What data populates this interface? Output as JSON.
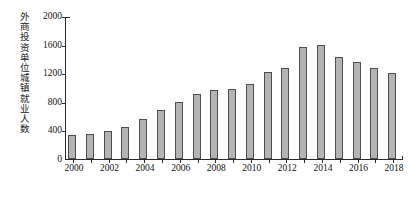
{
  "chart_data": {
    "type": "bar",
    "title": "",
    "xlabel": "",
    "ylabel": "外商投资单位城镇就业人数",
    "ylim": [
      0,
      2000
    ],
    "yticks": [
      0,
      400,
      800,
      1200,
      1600,
      2000
    ],
    "ytick_labels": [
      "0",
      "400",
      "800",
      "1200",
      "1600",
      "2000"
    ],
    "grid": false,
    "legend": null,
    "bar_color": "#b4b4b4",
    "bar_edge_color": "#4d4d4d",
    "axis_color": "#2b2b2b",
    "categories": [
      "2000",
      "2001",
      "2002",
      "2003",
      "2004",
      "2005",
      "2006",
      "2007",
      "2008",
      "2009",
      "2010",
      "2011",
      "2012",
      "2013",
      "2014",
      "2015",
      "2016",
      "2017",
      "2018"
    ],
    "xtick_labels": [
      "2000",
      "2002",
      "2004",
      "2006",
      "2008",
      "2010",
      "2012",
      "2014",
      "2016",
      "2018"
    ],
    "values": [
      332,
      345,
      391,
      454,
      563,
      688,
      796,
      903,
      962,
      978,
      1053,
      1218,
      1268,
      1566,
      1589,
      1424,
      1352,
      1275,
      1209
    ]
  }
}
